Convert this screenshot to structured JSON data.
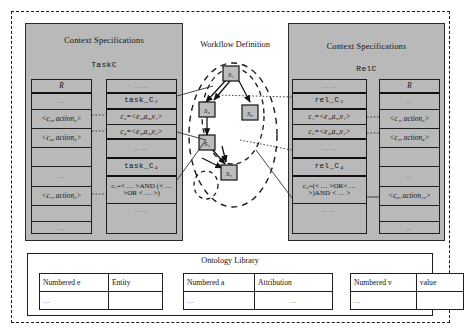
{
  "diagram": {
    "workflow": {
      "title": "Workflow Definition"
    },
    "left_panel": {
      "title": "Context Specifications",
      "subtitle": "TaskC",
      "r_table": {
        "header": "R",
        "rows": [
          "…",
          "<c₃, action₅>",
          "<c₄, action₆>",
          "",
          "…",
          "<c₇, action₉>",
          "",
          "…"
        ]
      },
      "c_table": {
        "rows": [
          "……",
          "task_C₂",
          "c₃=<e₂,a₃,v₁>",
          "c₄=<e₃,a₃,v₂>",
          "……",
          "task_C₄",
          "c₇=< … >AND (< … >OR < … >)",
          "……"
        ]
      }
    },
    "right_panel": {
      "title": "Context Specifications",
      "subtitle": "RelC",
      "c_table": {
        "rows": [
          "……",
          "rel_C₂",
          "c₁=<e₁,a₂,v₁>",
          "c₂=<e₃,a₂,v₂>",
          "……",
          "rel_C₄",
          "c₉=(< … >OR< … >)AND < … >",
          "……"
        ]
      },
      "r_table": {
        "header": "R",
        "rows": [
          "…",
          "<c₁, action₃>",
          "<c₂, action₄>",
          "",
          "…",
          "<c₈, action₁₅>",
          "",
          "…"
        ]
      }
    },
    "workflow_nodes": [
      {
        "id": "s1",
        "label": "S₁"
      },
      {
        "id": "s2",
        "label": "S₂"
      },
      {
        "id": "s3",
        "label": "S₃"
      },
      {
        "id": "s4",
        "label": "S₄"
      },
      {
        "id": "s5",
        "label": "S₅"
      }
    ],
    "ontology": {
      "title": "Ontology Library",
      "tables": [
        {
          "headers": [
            "Numbered e",
            "Entity"
          ],
          "row": [
            "…",
            ""
          ]
        },
        {
          "headers": [
            "Numbered a",
            "Attribution"
          ],
          "row": [
            "…",
            "…"
          ]
        },
        {
          "headers": [
            "Numbered v",
            "value"
          ],
          "row": [
            "…",
            ""
          ]
        }
      ]
    },
    "colors": {
      "panel_fill": "#b9b9b9",
      "line": "#1e1e1e",
      "page_bg": "#ffffff"
    }
  }
}
